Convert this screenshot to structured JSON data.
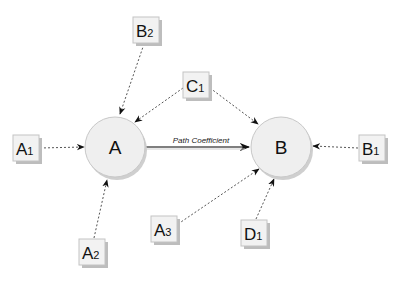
{
  "diagram": {
    "type": "path-model",
    "nodes": {
      "A": {
        "label": "A",
        "shape": "circle",
        "cx": 115,
        "cy": 147,
        "r": 30
      },
      "B": {
        "label": "B",
        "shape": "circle",
        "cx": 281,
        "cy": 147,
        "r": 30
      }
    },
    "indicators": {
      "A1": {
        "main": "A",
        "sub": "1",
        "x": 13,
        "y": 135
      },
      "A2": {
        "main": "A",
        "sub": "2",
        "x": 79,
        "y": 239
      },
      "A3": {
        "main": "A",
        "sub": "3",
        "x": 151,
        "y": 216
      },
      "B1": {
        "main": "B",
        "sub": "1",
        "x": 359,
        "y": 135
      },
      "B2": {
        "main": "B",
        "sub": "2",
        "x": 133,
        "y": 17
      },
      "C1": {
        "main": "C",
        "sub": "1",
        "x": 183,
        "y": 72
      },
      "D1": {
        "main": "D",
        "sub": "1",
        "x": 241,
        "y": 220
      }
    },
    "edges": [
      {
        "from": "A1",
        "to": "A",
        "style": "dashed"
      },
      {
        "from": "A2",
        "to": "A",
        "style": "dashed"
      },
      {
        "from": "B2",
        "to": "A",
        "style": "dashed"
      },
      {
        "from": "C1",
        "to": "A",
        "style": "dashed"
      },
      {
        "from": "C1",
        "to": "B",
        "style": "dashed"
      },
      {
        "from": "A3",
        "to": "B",
        "style": "dashed"
      },
      {
        "from": "D1",
        "to": "B",
        "style": "dashed"
      },
      {
        "from": "B1",
        "to": "B",
        "style": "dashed"
      },
      {
        "from": "A",
        "to": "B",
        "style": "solid",
        "label": "Path Coefficient"
      }
    ],
    "edge_label": "Path Coefficient",
    "colors": {
      "circle_fill": "#efefef",
      "circle_stroke": "#c8c8c8",
      "box_fill": "#f2f2f2",
      "box_stroke": "#c4c4c4",
      "shadow": "#bdbdbd",
      "edge": "#555555"
    }
  }
}
